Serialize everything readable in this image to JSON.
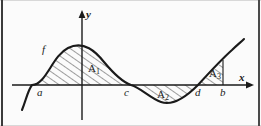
{
  "figure": {
    "kind": "calculus-signed-area-diagram",
    "background_color": "#fbfbfb",
    "ink_color": "#1a1a1a",
    "frame_color": "#3b3b3b"
  },
  "axes": {
    "x_axis_label": "x",
    "y_axis_label": "y",
    "x_axis_y_pixel": 85,
    "y_axis_x_pixel": 82,
    "x_axis_arrow": "arrow-right",
    "y_axis_arrow": "arrow-up"
  },
  "curve": {
    "label": "f",
    "shape": "sinusoid",
    "stroke_color": "#1a1a1a",
    "stroke_width": 2,
    "start_point": [
      22,
      110
    ],
    "end_point": [
      244,
      39
    ]
  },
  "points": [
    {
      "name": "a",
      "label": "a",
      "x_pixel": 32
    },
    {
      "name": "c",
      "label": "c",
      "x_pixel": 131
    },
    {
      "name": "d",
      "label": "d",
      "x_pixel": 198
    },
    {
      "name": "b",
      "label": "b",
      "x_pixel": 223
    }
  ],
  "regions": [
    {
      "name": "A1",
      "label": "A",
      "subscript": "1",
      "position": "above-axis",
      "from": "a",
      "to": "c",
      "fill": "diagonal-hatch"
    },
    {
      "name": "A2",
      "label": "A",
      "subscript": "2",
      "position": "below-axis",
      "from": "c",
      "to": "d",
      "fill": "diagonal-hatch"
    },
    {
      "name": "A3",
      "label": "A",
      "subscript": "3",
      "position": "above-axis",
      "from": "d",
      "to": "b",
      "fill": "diagonal-hatch"
    }
  ]
}
